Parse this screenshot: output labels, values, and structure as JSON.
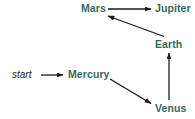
{
  "diagram": {
    "colors": {
      "node_text": "#2f6a5c",
      "start_text": "#1a1a1a",
      "edge": "#1a1a1a",
      "background": "#ffffff"
    },
    "nodes": [
      {
        "id": "start",
        "label": "start",
        "x": 12,
        "y": 69,
        "style": "italic-plain"
      },
      {
        "id": "mercury",
        "label": "Mercury",
        "x": 68,
        "y": 69,
        "style": "planet"
      },
      {
        "id": "venus",
        "label": "Venus",
        "x": 155,
        "y": 103,
        "style": "planet"
      },
      {
        "id": "earth",
        "label": "Earth",
        "x": 155,
        "y": 39,
        "style": "planet"
      },
      {
        "id": "mars",
        "label": "Mars",
        "x": 81,
        "y": 3,
        "style": "planet"
      },
      {
        "id": "jupiter",
        "label": "Jupiter",
        "x": 155,
        "y": 3,
        "style": "planet"
      }
    ],
    "edges": [
      {
        "id": "start-to-mercury",
        "from": "start",
        "to": "mercury",
        "label": "",
        "x1": 41,
        "y1": 75,
        "x2": 64,
        "y2": 75
      },
      {
        "id": "mercury-to-venus",
        "from": "mercury",
        "to": "venus",
        "label": "",
        "x1": 110,
        "y1": 79,
        "x2": 152,
        "y2": 104
      },
      {
        "id": "venus-to-earth",
        "from": "venus",
        "to": "earth",
        "label": "",
        "x1": 169,
        "y1": 100,
        "x2": 169,
        "y2": 54
      },
      {
        "id": "earth-to-mars",
        "from": "earth",
        "to": "mars",
        "label": "",
        "x1": 163,
        "y1": 36,
        "x2": 108,
        "y2": 16
      },
      {
        "id": "mars-to-jupiter",
        "from": "mars",
        "to": "jupiter",
        "label": "",
        "x1": 108,
        "y1": 9,
        "x2": 152,
        "y2": 9
      }
    ]
  }
}
